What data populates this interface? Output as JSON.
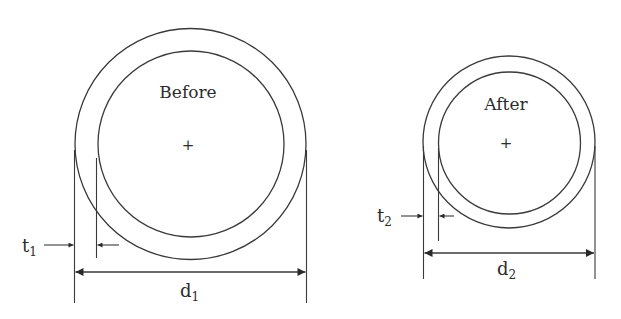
{
  "figure": {
    "colors": {
      "line": "#3a3a3a",
      "text": "#2c2c2c",
      "background": "#ffffff"
    },
    "before": {
      "label": "Before",
      "center_mark": "+",
      "thickness_symbol": "t",
      "thickness_subscript": "1",
      "diameter_symbol": "d",
      "diameter_subscript": "1"
    },
    "after": {
      "label": "After",
      "center_mark": "+",
      "thickness_symbol": "t",
      "thickness_subscript": "2",
      "diameter_symbol": "d",
      "diameter_subscript": "2"
    }
  }
}
